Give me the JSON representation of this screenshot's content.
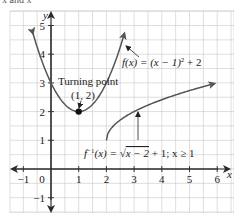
{
  "header": {
    "clipped_text": "x and x"
  },
  "chart_data": {
    "type": "line",
    "title": "",
    "xlabel": "x",
    "ylabel": "y",
    "xlim": [
      -1.5,
      6.5
    ],
    "ylim": [
      -1.5,
      5.5
    ],
    "grid": true,
    "minor_grid_step": 0.5,
    "x_ticks": [
      -1,
      0,
      1,
      2,
      3,
      4,
      5,
      6
    ],
    "x_tick_labels": [
      "−1",
      "0",
      "1",
      "2",
      "3",
      "4",
      "5",
      "6"
    ],
    "y_ticks": [
      -1,
      1,
      2,
      3,
      4,
      5
    ],
    "y_tick_labels": [
      "−1",
      "1",
      "2",
      "3",
      "4",
      "5"
    ],
    "series": [
      {
        "name": "f(x) = (x − 1)² + 2",
        "domain": [
          -0.65,
          2.65
        ],
        "points": [
          [
            -0.5,
            4.25
          ],
          [
            0,
            3
          ],
          [
            0.5,
            2.25
          ],
          [
            1,
            2
          ],
          [
            1.5,
            2.25
          ],
          [
            2,
            3
          ],
          [
            2.5,
            4.25
          ]
        ],
        "arrows": "both-ends"
      },
      {
        "name": "f⁻¹(x) = √(x − 2) + 1; x ≥ 1",
        "domain": [
          2,
          5.9
        ],
        "points": [
          [
            2,
            1
          ],
          [
            3,
            2
          ],
          [
            4,
            2.41
          ],
          [
            5,
            2.73
          ],
          [
            5.9,
            2.97
          ]
        ],
        "arrows": "end"
      }
    ],
    "annotations": [
      {
        "text": "Turning point",
        "point": [
          1,
          2
        ]
      },
      {
        "text": "(1, 2)",
        "point": [
          1,
          2
        ]
      },
      {
        "text": "f(x) = (x − 1)² + 2",
        "target_series": 0
      },
      {
        "text": "f⁻¹(x) = √(x − 2) + 1; x ≥ 1",
        "target_series": 1
      }
    ],
    "highlight_point": {
      "x": 1,
      "y": 2,
      "label": "Turning point (1, 2)"
    }
  },
  "labels": {
    "turning_point": "Turning point",
    "turning_point_coords": "(1, 2)",
    "f_label_prefix": "f(x) = (x − 1)",
    "f_label_exp": "2",
    "f_label_suffix": " + 2",
    "finv_label_prefix": "f",
    "finv_label_sup": "−1",
    "finv_label_mid": "(x) = ",
    "finv_label_sqrt": "x − 2",
    "finv_label_suffix": " + 1; x ≥ 1",
    "x_axis": "x",
    "y_axis": "y"
  },
  "colors": {
    "grid": "#c8c8c8",
    "axis": "#2a2a2a",
    "curve": "#555555",
    "point": "#111111"
  }
}
